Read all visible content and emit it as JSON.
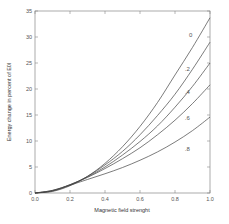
{
  "chart_data": {
    "type": "line",
    "title": "",
    "xlabel": "Magnetic field strenght",
    "ylabel": "Energy change in percent of E0l",
    "xlim": [
      0.0,
      1.0
    ],
    "ylim": [
      0,
      35
    ],
    "xticks": [
      "0.0",
      "0.2",
      "0.4",
      "0.6",
      "0.8",
      "1.0"
    ],
    "yticks": [
      "0",
      "5",
      "10",
      "15",
      "20",
      "25",
      "30",
      "35"
    ],
    "grid": false,
    "legend": "inline curve labels near right end",
    "x": [
      0.0,
      0.1,
      0.2,
      0.3,
      0.4,
      0.5,
      0.6,
      0.7,
      0.8,
      0.9,
      1.0
    ],
    "series": [
      {
        "name": "0",
        "values": [
          0,
          0.3,
          1.4,
          3.2,
          5.7,
          8.9,
          12.8,
          17.4,
          22.7,
          28.0,
          33.7
        ]
      },
      {
        "name": ".2",
        "values": [
          0,
          0.4,
          1.5,
          3.2,
          5.4,
          8.0,
          11.2,
          14.9,
          19.0,
          23.8,
          29.0
        ]
      },
      {
        "name": ".4",
        "values": [
          0,
          0.4,
          1.6,
          3.1,
          5.0,
          7.3,
          9.9,
          12.9,
          16.5,
          20.5,
          25.0
        ]
      },
      {
        "name": ".6",
        "values": [
          0,
          0.5,
          1.6,
          3.0,
          4.7,
          6.6,
          8.7,
          11.2,
          14.0,
          17.2,
          20.8
        ]
      },
      {
        "name": ".8",
        "values": [
          0,
          0.5,
          1.5,
          2.6,
          3.7,
          4.9,
          6.3,
          7.9,
          9.8,
          12.0,
          14.6
        ]
      }
    ],
    "label_positions": [
      {
        "name": "0",
        "x": 0.89,
        "y": 30.0
      },
      {
        "name": ".2",
        "x": 0.87,
        "y": 23.5
      },
      {
        "name": ".4",
        "x": 0.87,
        "y": 19.0
      },
      {
        "name": ".6",
        "x": 0.87,
        "y": 14.0
      },
      {
        "name": ".8",
        "x": 0.87,
        "y": 8.0
      }
    ]
  },
  "colors": {
    "line": "#444444",
    "axis": "#888888",
    "text": "#444444"
  }
}
